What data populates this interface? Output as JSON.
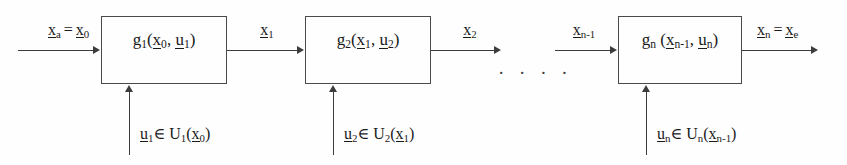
{
  "diagram": {
    "background_color": "#fefefe",
    "line_color": "#3c3c3c",
    "text_color": "#1a1a1a",
    "ellipsis": "· · · ·"
  },
  "stages": [
    {
      "id": "stage-1",
      "block_label": "g₁(x₀, u₁)",
      "block_function": "g",
      "block_index": "1",
      "block_args": "(x₀, u₁)",
      "input_label": "xₐ = x₀",
      "output_label": "x₁",
      "control_label": "u₁∈ U₁(x₀)"
    },
    {
      "id": "stage-2",
      "block_label": "g₂(x₁, u₂)",
      "block_function": "g",
      "block_index": "2",
      "block_args": "(x₁, u₂)",
      "input_label": "x₁",
      "output_label": "x₂",
      "control_label": "u₂∈ U₂(x₁)"
    },
    {
      "id": "stage-n",
      "block_label": "gₙ (xₙ₋₁, uₙ)",
      "block_function": "g",
      "block_index": "n",
      "block_args": "(xₙ₋₁, uₙ)",
      "input_label": "xₙ₋₁",
      "output_label": "xₙ = xₑ",
      "control_label": "uₙ∈ Uₙ(xₙ₋₁)"
    }
  ],
  "symbols": {
    "g": "g",
    "x": "x",
    "u": "u",
    "U": "U",
    "equals": "=",
    "element_of": "∈",
    "lparen": "(",
    "rparen": ")",
    "comma": ",",
    "sub_a": "a",
    "sub_e": "e",
    "sub_0": "0",
    "sub_1": "1",
    "sub_2": "2",
    "sub_n": "n",
    "sub_n_minus_1": "n-1"
  }
}
